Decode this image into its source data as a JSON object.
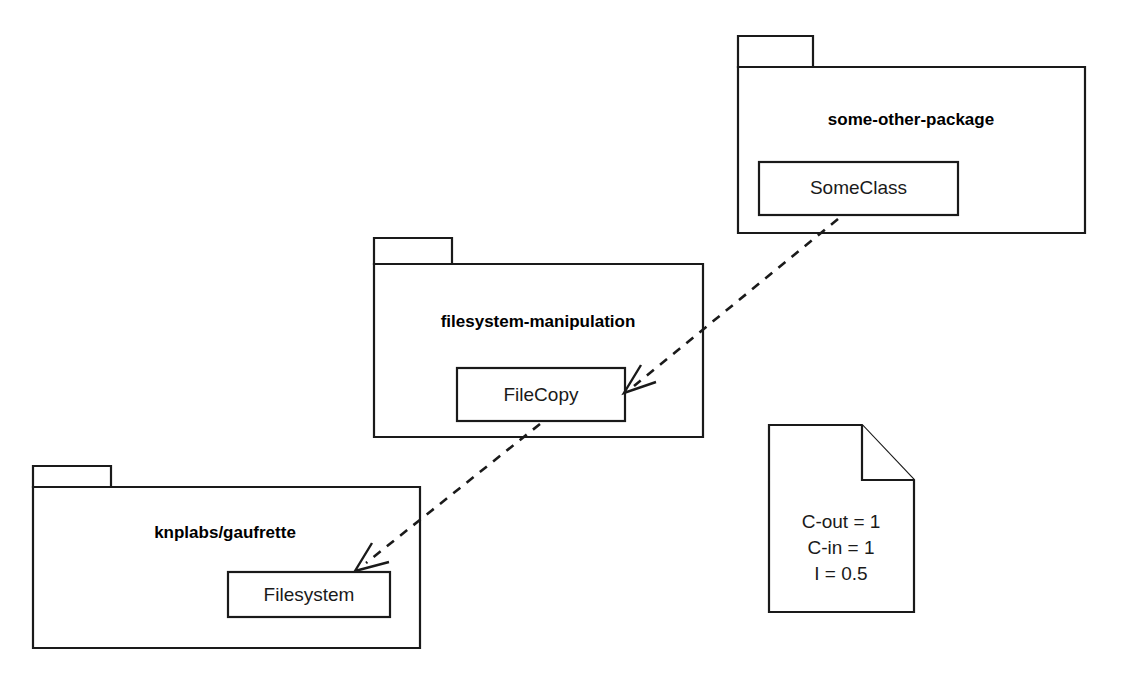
{
  "diagram": {
    "type": "uml-package-diagram",
    "background_color": "#ffffff",
    "stroke_color": "#1a1a1a",
    "packages": [
      {
        "id": "some-other-package",
        "label": "some-other-package",
        "classes": [
          {
            "id": "SomeClass",
            "label": "SomeClass"
          }
        ]
      },
      {
        "id": "filesystem-manipulation",
        "label": "filesystem-manipulation",
        "classes": [
          {
            "id": "FileCopy",
            "label": "FileCopy"
          }
        ]
      },
      {
        "id": "knplabs-gaufrette",
        "label": "knplabs/gaufrette",
        "classes": [
          {
            "id": "Filesystem",
            "label": "Filesystem"
          }
        ]
      }
    ],
    "dependencies": [
      {
        "from": "SomeClass",
        "to": "FileCopy",
        "style": "dashed",
        "arrow": "open"
      },
      {
        "from": "FileCopy",
        "to": "Filesystem",
        "style": "dashed",
        "arrow": "open"
      }
    ],
    "note": {
      "id": "metrics-note",
      "lines": [
        "C-out = 1",
        "C-in = 1",
        "I = 0.5"
      ]
    }
  }
}
